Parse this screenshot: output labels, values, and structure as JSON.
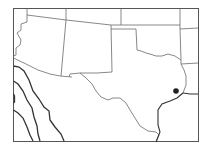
{
  "map": {
    "type": "outline-map",
    "region": "Southwestern / South-Central United States",
    "featured_state": "Texas",
    "marker": {
      "label": "",
      "shape": "dot",
      "color": "#222222",
      "x": 176,
      "y": 91
    },
    "colors": {
      "background": "#ffffff",
      "borders": "#6a6a6a",
      "contours": "#333333"
    }
  }
}
